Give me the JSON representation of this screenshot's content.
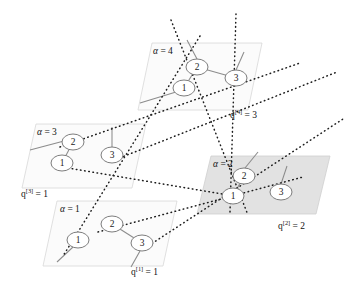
{
  "figure": {
    "colors": {
      "panel_light": "#fbfbfb",
      "panel_shaded": "#e2e2e2",
      "panel_border": "#d8d8d8",
      "intra_edge": "#8c8c8c",
      "inter_edge": "#1d1d1d",
      "node_fill": "#ffffff",
      "node_stroke": "#7d7d7d",
      "text": "#121212"
    }
  },
  "layers": [
    {
      "id": "layer-4",
      "alpha_symbol": "α",
      "alpha_equals": "=",
      "alpha_value": "4",
      "alpha_label": "α = 4",
      "q_base": "q",
      "q_superscript": "[4]",
      "q_equals": "=",
      "q_value": "3",
      "q_label": "q[4] = 3",
      "shaded": false,
      "nodes": [
        {
          "id": "l4n1",
          "label": "1",
          "cx": 184,
          "cy": 88
        },
        {
          "id": "l4n2",
          "label": "2",
          "cx": 197,
          "cy": 67
        },
        {
          "id": "l4n3",
          "label": "3",
          "cx": 236,
          "cy": 78
        }
      ],
      "edges": [
        {
          "from": "l4n1",
          "to": "l4n2"
        },
        {
          "from": "l4n2",
          "to": "l4n3"
        }
      ]
    },
    {
      "id": "layer-3",
      "alpha_symbol": "α",
      "alpha_equals": "=",
      "alpha_value": "3",
      "alpha_label": "α = 3",
      "q_base": "q",
      "q_superscript": "[3]",
      "q_equals": "=",
      "q_value": "1",
      "q_label": "q[3] = 1",
      "shaded": false,
      "nodes": [
        {
          "id": "l3n1",
          "label": "1",
          "cx": 62,
          "cy": 163
        },
        {
          "id": "l3n2",
          "label": "2",
          "cx": 73,
          "cy": 142
        },
        {
          "id": "l3n3",
          "label": "3",
          "cx": 112,
          "cy": 155
        }
      ],
      "edges": [
        {
          "from": "l3n1",
          "to": "l3n2"
        }
      ]
    },
    {
      "id": "layer-2",
      "alpha_symbol": "α",
      "alpha_equals": "=",
      "alpha_value": "2",
      "alpha_label": "α = 2",
      "q_base": "q",
      "q_superscript": "[2]",
      "q_equals": "=",
      "q_value": "2",
      "q_label": "q[2] = 2",
      "shaded": true,
      "nodes": [
        {
          "id": "l2n1",
          "label": "1",
          "cx": 233,
          "cy": 196
        },
        {
          "id": "l2n2",
          "label": "2",
          "cx": 244,
          "cy": 176
        },
        {
          "id": "l2n3",
          "label": "3",
          "cx": 281,
          "cy": 192
        }
      ],
      "edges": [
        {
          "from": "l2n1",
          "to": "l2n2"
        }
      ]
    },
    {
      "id": "layer-1",
      "alpha_symbol": "α",
      "alpha_equals": "=",
      "alpha_value": "1",
      "alpha_label": "α = 1",
      "q_base": "q",
      "q_superscript": "[1]",
      "q_equals": "=",
      "q_value": "1",
      "q_label": "q[1] = 1",
      "shaded": false,
      "nodes": [
        {
          "id": "l1n1",
          "label": "1",
          "cx": 78,
          "cy": 240
        },
        {
          "id": "l1n2",
          "label": "2",
          "cx": 112,
          "cy": 224
        },
        {
          "id": "l1n3",
          "label": "3",
          "cx": 142,
          "cy": 243
        }
      ],
      "edges": [
        {
          "from": "l1n2",
          "to": "l1n3"
        }
      ]
    }
  ],
  "interlayer_edges": [
    {
      "from": "l3n2",
      "to": "l4n1"
    },
    {
      "from": "l4n1",
      "to": "l1n1"
    },
    {
      "from": "l4n1",
      "to": "l2n1"
    },
    {
      "from": "l4n2",
      "to": "l2n2"
    },
    {
      "from": "l3n1",
      "to": "l2n1"
    },
    {
      "from": "l1n2",
      "to": "l2n1"
    },
    {
      "from": "l1n3",
      "to": "l2n3"
    },
    {
      "from": "l3n3",
      "to": "l4n3"
    }
  ]
}
